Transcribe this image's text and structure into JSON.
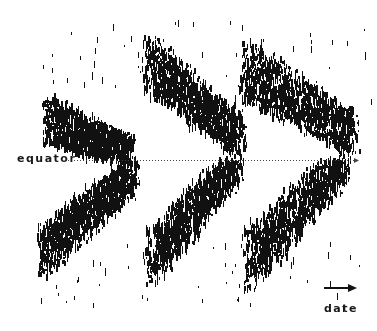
{
  "chart_data": {
    "type": "scatter",
    "subtype": "butterfly-diagram",
    "title": "",
    "xlabel": "date",
    "ylabel": "",
    "annotations": [
      "equator"
    ],
    "grid": false,
    "legend": null,
    "x_axis_direction": "right (arrow)",
    "equator_y": 160,
    "equator_line": {
      "x_start": 68,
      "x_end": 355,
      "style": "dotted",
      "arrowhead": true
    },
    "cycles": [
      {
        "name": "cycle-1",
        "north": {
          "start_x": 48,
          "end_x": 130,
          "start_top": 95,
          "end_top": 135,
          "band": 45
        },
        "south": {
          "start_x": 42,
          "end_x": 132,
          "start_bottom": 280,
          "end_bottom": 195,
          "band": 50
        }
      },
      {
        "name": "cycle-2",
        "north": {
          "start_x": 148,
          "end_x": 240,
          "start_top": 32,
          "end_top": 115,
          "band": 55
        },
        "south": {
          "start_x": 150,
          "end_x": 238,
          "start_bottom": 290,
          "end_bottom": 185,
          "band": 55
        }
      },
      {
        "name": "cycle-3",
        "north": {
          "start_x": 245,
          "end_x": 352,
          "start_top": 38,
          "end_top": 110,
          "band": 60
        },
        "south": {
          "start_x": 248,
          "end_x": 345,
          "start_bottom": 295,
          "end_bottom": 185,
          "band": 60
        }
      }
    ],
    "marker": "short vertical tick",
    "marker_color": "#111111"
  },
  "labels": {
    "equator": "equator",
    "date": "date"
  },
  "colors": {
    "background": "#ffffff",
    "ink": "#111111"
  }
}
